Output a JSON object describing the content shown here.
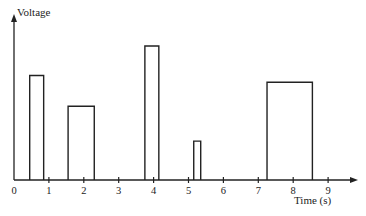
{
  "chart_data": {
    "type": "bar",
    "title": "",
    "xlabel": "Time (s)",
    "ylabel": "Voltage",
    "x_ticks": [
      "0",
      "1",
      "2",
      "3",
      "4",
      "5",
      "6",
      "7",
      "8",
      "9"
    ],
    "xlim": [
      0,
      9.9
    ],
    "y_axis_numeric": false,
    "grid": false,
    "legend": null,
    "series": [
      {
        "name": "Voltage pulses",
        "note": "Rectangular pulses; heights are relative (no y-axis scale shown)",
        "pulses": [
          {
            "start": 0.45,
            "end": 0.85,
            "height": 0.78
          },
          {
            "start": 1.55,
            "end": 2.3,
            "height": 0.55
          },
          {
            "start": 3.75,
            "end": 4.15,
            "height": 1.0
          },
          {
            "start": 5.15,
            "end": 5.35,
            "height": 0.29
          },
          {
            "start": 7.25,
            "end": 8.55,
            "height": 0.73
          }
        ]
      }
    ]
  },
  "axis": {
    "y_label": "Voltage",
    "x_label": "Time (s)",
    "tick_labels": [
      "0",
      "1",
      "2",
      "3",
      "4",
      "5",
      "6",
      "7",
      "8",
      "9"
    ]
  },
  "colors": {
    "line": "#222222",
    "background": "#ffffff"
  }
}
